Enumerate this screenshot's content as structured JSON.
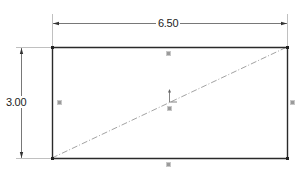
{
  "sketch": {
    "rectangle": {
      "x1": 52,
      "y1": 47,
      "x2": 287,
      "y2": 158
    },
    "dimensions": {
      "width": {
        "label": "6.50"
      },
      "height": {
        "label": "3.00"
      }
    },
    "relations": [
      {
        "type": "horizontal",
        "edge": "top"
      },
      {
        "type": "horizontal",
        "edge": "bottom"
      },
      {
        "type": "vertical",
        "edge": "left"
      },
      {
        "type": "vertical",
        "edge": "right"
      },
      {
        "type": "midpoint",
        "edge": "diagonal"
      }
    ],
    "construction_line": {
      "type": "diagonal",
      "style": "centerline"
    },
    "colors": {
      "line": "#2a2a2a",
      "dimension": "#555555",
      "centerline": "#8a8a8a",
      "marker": "#9a9a9a"
    }
  }
}
